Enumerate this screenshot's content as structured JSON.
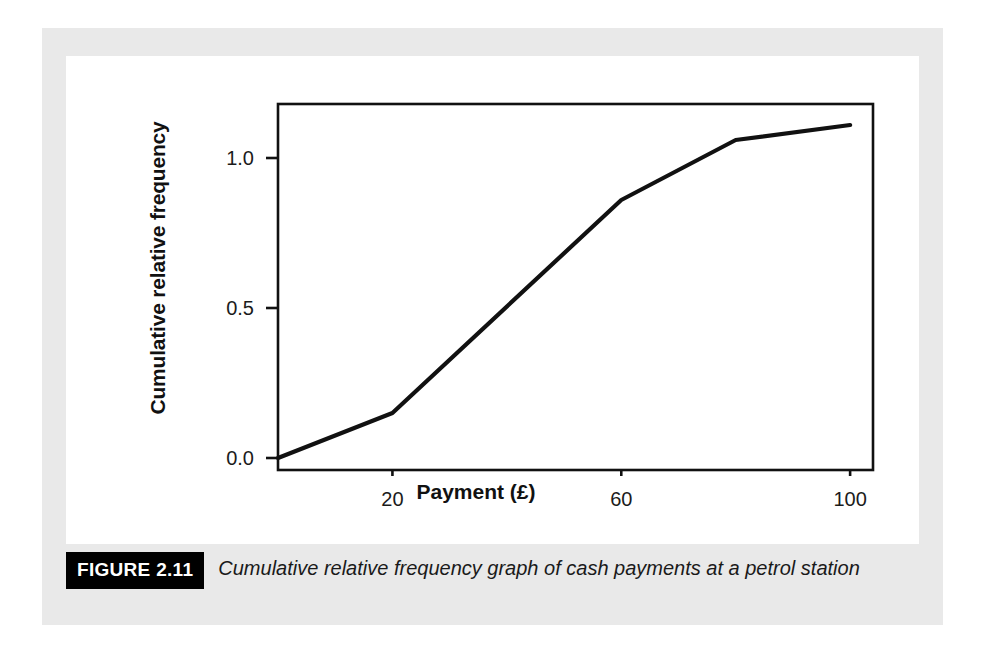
{
  "figure": {
    "badge": "FIGURE 2.11",
    "caption": "Cumulative relative frequency graph of cash payments at a petrol station"
  },
  "colors": {
    "panel_background": "#e9e9e9",
    "card_background": "#ffffff",
    "axis": "#111111",
    "line": "#111111",
    "badge_background": "#000000",
    "badge_text": "#ffffff"
  },
  "chart_data": {
    "type": "line",
    "title": "",
    "subtitle": "",
    "xlabel": "Payment (£)",
    "ylabel": "Cumulative relative frequency",
    "xlim": [
      0,
      104
    ],
    "ylim": [
      -0.04,
      1.18
    ],
    "xticks": [
      20,
      60,
      100
    ],
    "xtick_labels": [
      "20",
      "60",
      "100"
    ],
    "yticks": [
      0.0,
      0.5,
      1.0
    ],
    "ytick_labels": [
      "0.0",
      "0.5",
      "1.0"
    ],
    "grid": false,
    "legend": false,
    "legend_position": "none",
    "series": [
      {
        "name": "Cumulative relative frequency",
        "x": [
          0,
          20,
          60,
          80,
          100
        ],
        "values": [
          0.0,
          0.15,
          0.86,
          1.06,
          1.11
        ]
      }
    ]
  }
}
